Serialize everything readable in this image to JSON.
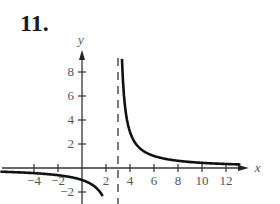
{
  "problem": {
    "number": "11."
  },
  "chart_data": {
    "type": "line",
    "title": "",
    "function": "y = 3/(x - 3)",
    "xlabel": "x",
    "ylabel": "y",
    "xlim": [
      -4.5,
      13.5
    ],
    "ylim": [
      -2.5,
      9.5
    ],
    "x_ticks": [
      -4,
      -2,
      2,
      4,
      6,
      8,
      10,
      12
    ],
    "x_tick_labels": [
      "-4",
      "-2",
      "2",
      "4",
      "6",
      "8",
      "10",
      "12"
    ],
    "y_ticks": [
      -2,
      2,
      4,
      6,
      8
    ],
    "y_tick_labels": [
      "-2",
      "2",
      "4",
      "6",
      "8"
    ],
    "vertical_asymptote": {
      "x": 3,
      "style": "dashed"
    },
    "horizontal_asymptote": {
      "y": 0
    },
    "grid": false,
    "series": [
      {
        "name": "left branch",
        "x": [
          -4.5,
          -4,
          -3,
          -2,
          -1,
          0,
          1,
          1.5,
          2,
          2.2
        ],
        "y": [
          -0.4,
          -0.43,
          -0.5,
          -0.6,
          -0.75,
          -1,
          -1.5,
          -2,
          -3,
          -3.75
        ]
      },
      {
        "name": "right branch",
        "x": [
          3.33,
          3.5,
          4,
          4.5,
          5,
          6,
          7,
          8,
          10,
          12,
          13
        ],
        "y": [
          9,
          6,
          3,
          2,
          1.5,
          1,
          0.75,
          0.6,
          0.43,
          0.33,
          0.3
        ]
      }
    ]
  }
}
